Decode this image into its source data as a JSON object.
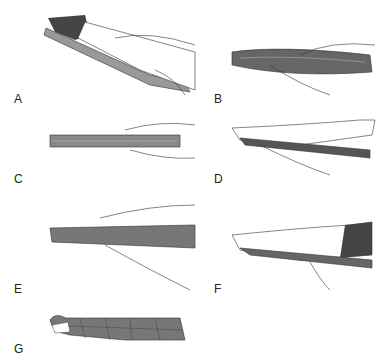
{
  "figure": {
    "panels": [
      {
        "id": "A",
        "label": "A",
        "description": "Splint material laid along forearm, hands positioning"
      },
      {
        "id": "B",
        "label": "B",
        "description": "Splint material held and folded"
      },
      {
        "id": "C",
        "label": "C",
        "description": "Splint material folded flat held by hands"
      },
      {
        "id": "D",
        "label": "D",
        "description": "Splint applied under forearm"
      },
      {
        "id": "E",
        "label": "E",
        "description": "Splint smoothed along length"
      },
      {
        "id": "F",
        "label": "F",
        "description": "Splint molded to forearm"
      },
      {
        "id": "G",
        "label": "G",
        "description": "Splint wrapped with bandage"
      }
    ],
    "colors": {
      "splint": "#777777",
      "splint_dark": "#555555",
      "skin": "#ffffff",
      "outline": "#333333"
    }
  }
}
